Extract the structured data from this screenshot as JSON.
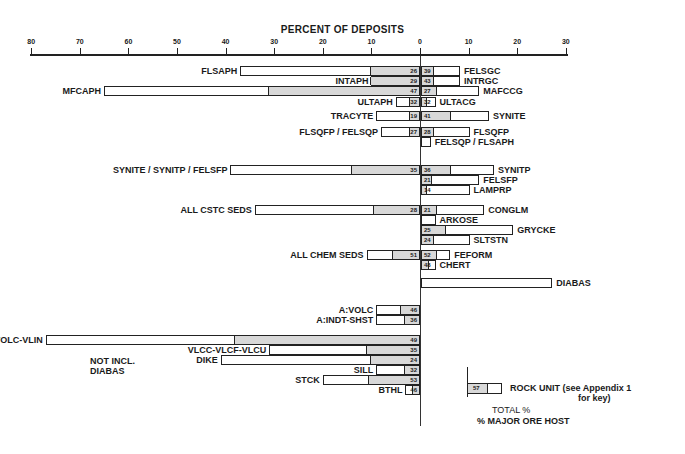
{
  "chart_data": {
    "type": "bar",
    "title": "PERCENT OF DEPOSITS",
    "xlabel": "PERCENT OF DEPOSITS",
    "ylabel": "",
    "x_ticks": [
      80,
      70,
      60,
      50,
      40,
      30,
      20,
      10,
      0,
      10,
      20,
      30
    ],
    "xlim": [
      -80,
      30
    ],
    "note": "Left-side bars extend leftward; shaded portion is % major ore host, numbers are shaded % of total",
    "left_bars": [
      {
        "name": "FLSAPH",
        "total": 37,
        "host": 10,
        "label_num": "26",
        "y": 66
      },
      {
        "name": "INTAPH",
        "total": 10,
        "host": 10,
        "label_num": "29",
        "y": 76
      },
      {
        "name": "MFCAPH",
        "total": 65,
        "host": 31,
        "label_num": "47",
        "y": 86
      },
      {
        "name": "ULTAPH",
        "total": 5,
        "host": 2,
        "label_num": "32",
        "y": 97
      },
      {
        "name": "TRACYTE",
        "total": 9,
        "host": 2,
        "label_num": "19",
        "y": 111
      },
      {
        "name": "FLSQFP / FELSQP",
        "total": 8,
        "host": 2,
        "label_num": "27",
        "y": 127
      },
      {
        "name": "SYNITE / SYNITP / FELSFP",
        "total": 39,
        "host": 14,
        "label_num": "35",
        "y": 165
      },
      {
        "name": "ALL CSTC SEDS",
        "total": 34,
        "host": 9.5,
        "label_num": "28",
        "y": 205
      },
      {
        "name": "ALL CHEM SEDS",
        "total": 11,
        "host": 5.5,
        "label_num": "51",
        "y": 250
      },
      {
        "name": "A:VOLC",
        "total": 9,
        "host": 4,
        "label_num": "46",
        "y": 305
      },
      {
        "name": "A:INDT-SHST",
        "total": 9,
        "host": 3,
        "label_num": "36",
        "y": 315
      },
      {
        "name": "VOLC-VLIN",
        "total": 77,
        "host": 38,
        "label_num": "49",
        "y": 335
      },
      {
        "name": "VLCC-VLCF-VLCU",
        "total": 31,
        "host": 11,
        "label_num": "35",
        "y": 345
      },
      {
        "name": "DIKE",
        "total": 41,
        "host": 10,
        "label_num": "24",
        "y": 355
      },
      {
        "name": "SILL",
        "total": 9,
        "host": 3,
        "label_num": "32",
        "y": 365
      },
      {
        "name": "STCK",
        "total": 20,
        "host": 10.5,
        "label_num": "53",
        "y": 375
      },
      {
        "name": "BTHL",
        "total": 3,
        "host": 1.5,
        "label_num": "46",
        "y": 385
      }
    ],
    "right_bars": [
      {
        "name": "FELSGC",
        "total": 8,
        "host": 2.5,
        "label_num": "39",
        "y": 66
      },
      {
        "name": "INTRGC",
        "total": 8,
        "host": 2.5,
        "label_num": "43",
        "y": 76
      },
      {
        "name": "MAFCCG",
        "total": 12,
        "host": 3,
        "label_num": "27",
        "y": 86
      },
      {
        "name": "ULTACG",
        "total": 3,
        "host": 1,
        "label_num": "32",
        "y": 97
      },
      {
        "name": "SYNITE",
        "total": 14,
        "host": 6,
        "label_num": "41",
        "y": 111
      },
      {
        "name": "FLSQFP",
        "total": 10,
        "host": 2.5,
        "label_num": "28",
        "y": 127
      },
      {
        "name": "FELSQP / FLSAPH",
        "total": 2,
        "host": 0,
        "label_num": "",
        "y": 137
      },
      {
        "name": "SYNITP",
        "total": 15,
        "host": 6,
        "label_num": "36",
        "y": 165
      },
      {
        "name": "FELSFP",
        "total": 12,
        "host": 2,
        "label_num": "21",
        "y": 175
      },
      {
        "name": "LAMPRP",
        "total": 10,
        "host": 1,
        "label_num": "14",
        "y": 185
      },
      {
        "name": "CONGLM",
        "total": 13,
        "host": 3,
        "label_num": "21",
        "y": 205
      },
      {
        "name": "ARKOSE",
        "total": 3,
        "host": 0,
        "label_num": "",
        "y": 215
      },
      {
        "name": "GRYCKE",
        "total": 19,
        "host": 5,
        "label_num": "25",
        "y": 225
      },
      {
        "name": "SLTSTN",
        "total": 10,
        "host": 2.5,
        "label_num": "24",
        "y": 235
      },
      {
        "name": "FEFORM",
        "total": 6,
        "host": 3,
        "label_num": "52",
        "y": 250
      },
      {
        "name": "CHERT",
        "total": 3,
        "host": 1.5,
        "label_num": "48",
        "y": 260
      },
      {
        "name": "DIABAS",
        "total": 27,
        "host": 0,
        "label_num": "",
        "y": 278
      }
    ],
    "legend": {
      "sample_value": "57",
      "rock_unit": "ROCK UNIT (see Appendix 1",
      "rock_unit_2": "for key)",
      "total": "TOTAL %",
      "host": "% MAJOR ORE HOST"
    },
    "bracket_note": [
      "NOT INCL.",
      "DIABAS"
    ]
  }
}
